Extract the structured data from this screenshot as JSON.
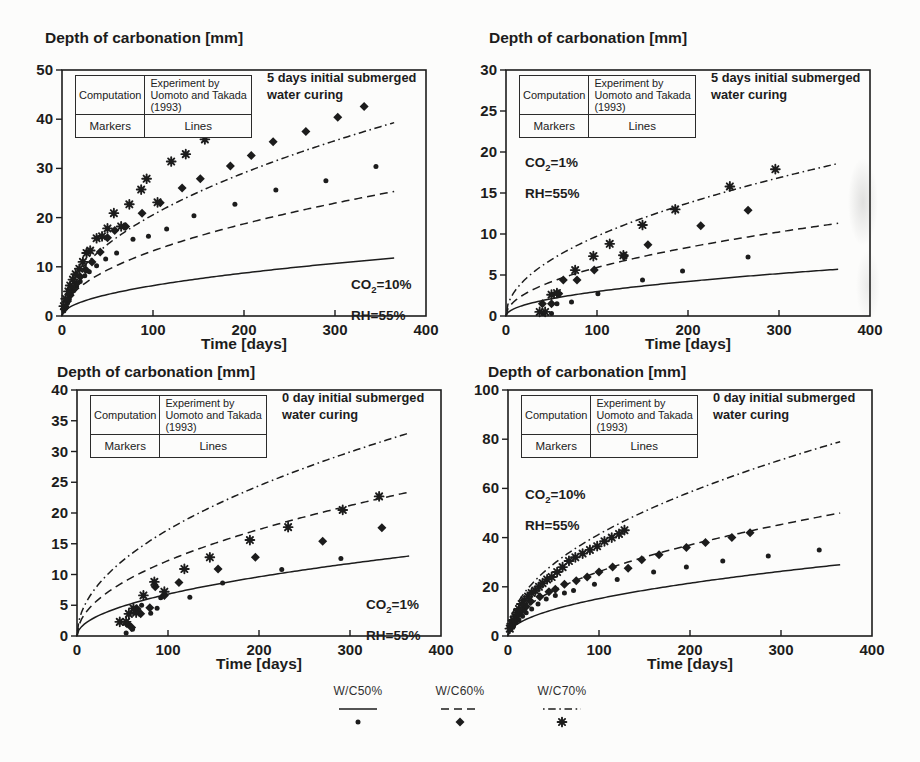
{
  "style": {
    "ink": "#1c1c1c",
    "paper": "#fcfcfb"
  },
  "inset_table": {
    "row1": [
      "Computation",
      "Experiment by Uomoto and Takada (1993)"
    ],
    "row2": [
      "Markers",
      "Lines"
    ]
  },
  "legend": {
    "items": [
      {
        "label": "W/C50%",
        "line_style": "solid",
        "marker": "dot"
      },
      {
        "label": "W/C60%",
        "line_style": "dashed",
        "marker": "diamond"
      },
      {
        "label": "W/C70%",
        "line_style": "dashdot",
        "marker": "star"
      }
    ]
  },
  "chart_data": [
    {
      "type": "line+scatter",
      "title": "Depth of carbonation [mm]",
      "xlabel": "Time [days]",
      "condition_note": "5 days initial submerged water curing",
      "co2": {
        "base": "CO",
        "sub": "2",
        "rest": "=10%"
      },
      "rh": "RH=55%",
      "xlim": [
        0,
        400
      ],
      "ylim": [
        0,
        50
      ],
      "xticks": [
        0,
        100,
        200,
        300,
        400
      ],
      "yticks": [
        0,
        10,
        20,
        30,
        40,
        50
      ],
      "series": [
        {
          "name": "W/C50% computation",
          "kind": "line",
          "style": "solid",
          "value_at_365": 11.8
        },
        {
          "name": "W/C60% computation",
          "kind": "line",
          "style": "dashed",
          "value_at_365": 25.3
        },
        {
          "name": "W/C70% computation",
          "kind": "line",
          "style": "dashdot",
          "value_at_365": 39.3
        },
        {
          "name": "W/C50% experiment",
          "kind": "scatter",
          "marker": "dot",
          "points": [
            [
              2,
              1
            ],
            [
              4,
              2
            ],
            [
              6,
              2.6
            ],
            [
              8,
              3.4
            ],
            [
              10,
              4.4
            ],
            [
              13,
              5.2
            ],
            [
              16,
              6
            ],
            [
              20,
              7
            ],
            [
              25,
              8.2
            ],
            [
              30,
              9
            ],
            [
              38,
              10.2
            ],
            [
              48,
              11.6
            ],
            [
              60,
              12.8
            ],
            [
              78,
              15.6
            ],
            [
              95,
              16.2
            ],
            [
              115,
              17.7
            ],
            [
              145,
              20.4
            ],
            [
              190,
              22.7
            ],
            [
              235,
              25.6
            ],
            [
              290,
              27.5
            ],
            [
              345,
              30.4
            ]
          ]
        },
        {
          "name": "W/C60% experiment",
          "kind": "scatter",
          "marker": "diamond",
          "points": [
            [
              3,
              1.6
            ],
            [
              6,
              3
            ],
            [
              9,
              4.2
            ],
            [
              12,
              5.4
            ],
            [
              16,
              6.6
            ],
            [
              20,
              8
            ],
            [
              26,
              9.4
            ],
            [
              33,
              11
            ],
            [
              42,
              13
            ],
            [
              50,
              15.9
            ],
            [
              58,
              17.4
            ],
            [
              70,
              18.2
            ],
            [
              88,
              20.9
            ],
            [
              108,
              23
            ],
            [
              132,
              26
            ],
            [
              152,
              27.9
            ],
            [
              185,
              30.5
            ],
            [
              208,
              32.6
            ],
            [
              232,
              35.4
            ],
            [
              268,
              37.5
            ],
            [
              303,
              40.4
            ],
            [
              332,
              42.6
            ]
          ]
        },
        {
          "name": "W/C70% experiment",
          "kind": "scatter",
          "marker": "star",
          "points": [
            [
              2,
              2
            ],
            [
              4,
              3.5
            ],
            [
              7,
              5
            ],
            [
              9,
              6.2
            ],
            [
              12,
              7.4
            ],
            [
              15,
              8.5
            ],
            [
              19,
              9.6
            ],
            [
              23,
              11
            ],
            [
              27,
              12.8
            ],
            [
              31,
              13.3
            ],
            [
              38,
              15.8
            ],
            [
              44,
              16.2
            ],
            [
              50,
              17.8
            ],
            [
              57,
              20.9
            ],
            [
              65,
              18.2
            ],
            [
              74,
              22.7
            ],
            [
              87,
              25.7
            ],
            [
              93,
              27.9
            ],
            [
              105,
              23.1
            ],
            [
              120,
              31.4
            ],
            [
              136,
              32.9
            ],
            [
              157,
              35.9
            ]
          ]
        }
      ]
    },
    {
      "type": "line+scatter",
      "title": "Depth of carbonation [mm]",
      "xlabel": "Time [days]",
      "condition_note": "5 days initial submerged water curing",
      "co2": {
        "base": "CO",
        "sub": "2",
        "rest": "=1%"
      },
      "rh": "RH=55%",
      "xlim": [
        0,
        400
      ],
      "ylim": [
        0,
        30
      ],
      "xticks": [
        0,
        100,
        200,
        300,
        400
      ],
      "yticks": [
        0,
        5,
        10,
        15,
        20,
        25,
        30
      ],
      "series": [
        {
          "name": "W/C50% computation",
          "kind": "line",
          "style": "solid",
          "value_at_365": 5.7
        },
        {
          "name": "W/C60% computation",
          "kind": "line",
          "style": "dashed",
          "value_at_365": 11.3
        },
        {
          "name": "W/C70% computation",
          "kind": "line",
          "style": "dashdot",
          "value_at_365": 18.6
        },
        {
          "name": "W/C50% experiment",
          "kind": "scatter",
          "marker": "dot",
          "points": [
            [
              41,
              0.3
            ],
            [
              50,
              0.3
            ],
            [
              56,
              1.5
            ],
            [
              72,
              1.7
            ],
            [
              101,
              2.7
            ],
            [
              150,
              4.4
            ],
            [
              194,
              5.5
            ],
            [
              266,
              7.2
            ]
          ]
        },
        {
          "name": "W/C60% experiment",
          "kind": "scatter",
          "marker": "diamond",
          "points": [
            [
              40,
              1.5
            ],
            [
              50,
              1.5
            ],
            [
              58,
              2.7
            ],
            [
              63,
              4.4
            ],
            [
              78,
              4.4
            ],
            [
              97,
              5.6
            ],
            [
              130,
              7.3
            ],
            [
              156,
              8.7
            ],
            [
              214,
              11
            ],
            [
              266,
              12.9
            ]
          ]
        },
        {
          "name": "W/C70% experiment",
          "kind": "scatter",
          "marker": "star",
          "points": [
            [
              37,
              0.5
            ],
            [
              43,
              0.5
            ],
            [
              50,
              2.6
            ],
            [
              56,
              2.8
            ],
            [
              76,
              5.6
            ],
            [
              96,
              7.3
            ],
            [
              114,
              8.8
            ],
            [
              129,
              7.4
            ],
            [
              150,
              11.1
            ],
            [
              186,
              13
            ],
            [
              246,
              15.8
            ],
            [
              296,
              17.9
            ]
          ]
        }
      ]
    },
    {
      "type": "line+scatter",
      "title": "Depth of carbonation [mm]",
      "xlabel": "Time [days]",
      "condition_note": "0 day initial submerged water curing",
      "co2": {
        "base": "CO",
        "sub": "2",
        "rest": "=1%"
      },
      "rh": "RH=55%",
      "xlim": [
        0,
        400
      ],
      "ylim": [
        0,
        40
      ],
      "xticks": [
        0,
        100,
        200,
        300,
        400
      ],
      "yticks": [
        0,
        5,
        10,
        15,
        20,
        25,
        30,
        35,
        40
      ],
      "series": [
        {
          "name": "W/C50% computation",
          "kind": "line",
          "style": "solid",
          "value_at_365": 13.0
        },
        {
          "name": "W/C60% computation",
          "kind": "line",
          "style": "dashed",
          "value_at_365": 23.4
        },
        {
          "name": "W/C70% computation",
          "kind": "line",
          "style": "dashdot",
          "value_at_365": 33.0
        },
        {
          "name": "W/C50% experiment",
          "kind": "scatter",
          "marker": "dot",
          "points": [
            [
              54,
              0.5
            ],
            [
              58,
              1.8
            ],
            [
              61,
              1.1
            ],
            [
              71,
              5
            ],
            [
              81,
              3.7
            ],
            [
              88,
              4.5
            ],
            [
              92,
              6.2
            ],
            [
              124,
              6.3
            ],
            [
              160,
              8.6
            ],
            [
              225,
              10.8
            ],
            [
              290,
              12.6
            ]
          ]
        },
        {
          "name": "W/C60% experiment",
          "kind": "scatter",
          "marker": "diamond",
          "points": [
            [
              55,
              2
            ],
            [
              60,
              1.4
            ],
            [
              66,
              4.4
            ],
            [
              70,
              3.6
            ],
            [
              80,
              4.6
            ],
            [
              86,
              8
            ],
            [
              96,
              6.6
            ],
            [
              112,
              8.7
            ],
            [
              155,
              10.9
            ],
            [
              196,
              12.8
            ],
            [
              270,
              15.4
            ],
            [
              335,
              17.6
            ]
          ]
        },
        {
          "name": "W/C70% experiment",
          "kind": "scatter",
          "marker": "star",
          "points": [
            [
              47,
              2.3
            ],
            [
              54,
              2.3
            ],
            [
              57,
              3.6
            ],
            [
              62,
              4.5
            ],
            [
              65,
              3.8
            ],
            [
              73,
              6.6
            ],
            [
              85,
              8.8
            ],
            [
              96,
              7.2
            ],
            [
              118,
              10.9
            ],
            [
              146,
              12.8
            ],
            [
              190,
              15.6
            ],
            [
              232,
              17.7
            ],
            [
              292,
              20.5
            ],
            [
              332,
              22.7
            ]
          ]
        }
      ]
    },
    {
      "type": "line+scatter",
      "title": "Depth of carbonation [mm]",
      "xlabel": "Time [days]",
      "condition_note": "0 day initial submerged water curing",
      "co2": {
        "base": "CO",
        "sub": "2",
        "rest": "=10%"
      },
      "rh": "RH=55%",
      "xlim": [
        0,
        400
      ],
      "ylim": [
        0,
        100
      ],
      "xticks": [
        0,
        100,
        200,
        300,
        400
      ],
      "yticks": [
        0,
        20,
        40,
        60,
        80,
        100
      ],
      "series": [
        {
          "name": "W/C50% computation",
          "kind": "line",
          "style": "solid",
          "value_at_365": 29
        },
        {
          "name": "W/C60% computation",
          "kind": "line",
          "style": "dashed",
          "value_at_365": 50
        },
        {
          "name": "W/C70% computation",
          "kind": "line",
          "style": "dashdot",
          "value_at_365": 79
        },
        {
          "name": "W/C50% experiment",
          "kind": "scatter",
          "marker": "dot",
          "points": [
            [
              3,
              2.5
            ],
            [
              6,
              4
            ],
            [
              9,
              5.5
            ],
            [
              12,
              6.5
            ],
            [
              16,
              8
            ],
            [
              20,
              9.5
            ],
            [
              26,
              11
            ],
            [
              33,
              13
            ],
            [
              42,
              15
            ],
            [
              52,
              16.5
            ],
            [
              62,
              17.5
            ],
            [
              72,
              18.5
            ],
            [
              95,
              21
            ],
            [
              120,
              23
            ],
            [
              160,
              26
            ],
            [
              196,
              28
            ],
            [
              236,
              30.5
            ],
            [
              286,
              32.5
            ],
            [
              342,
              35
            ]
          ]
        },
        {
          "name": "W/C60% experiment",
          "kind": "scatter",
          "marker": "diamond",
          "points": [
            [
              3,
              3.5
            ],
            [
              6,
              5.5
            ],
            [
              9,
              7
            ],
            [
              12,
              9
            ],
            [
              16,
              10.5
            ],
            [
              20,
              12
            ],
            [
              25,
              14
            ],
            [
              35,
              16
            ],
            [
              45,
              18
            ],
            [
              52,
              19
            ],
            [
              62,
              21
            ],
            [
              75,
              22.5
            ],
            [
              87,
              24
            ],
            [
              100,
              26
            ],
            [
              115,
              28
            ],
            [
              132,
              27.5
            ],
            [
              147,
              31
            ],
            [
              166,
              33
            ],
            [
              196,
              36
            ],
            [
              217,
              38
            ],
            [
              246,
              40
            ],
            [
              266,
              42
            ]
          ]
        },
        {
          "name": "W/C70% experiment",
          "kind": "scatter",
          "marker": "star",
          "points": [
            [
              2,
              3
            ],
            [
              4,
              5
            ],
            [
              6,
              6.5
            ],
            [
              8,
              8
            ],
            [
              10,
              9.5
            ],
            [
              12,
              11
            ],
            [
              15,
              13
            ],
            [
              18,
              14.5
            ],
            [
              22,
              16
            ],
            [
              26,
              17.5
            ],
            [
              30,
              18.5
            ],
            [
              34,
              20
            ],
            [
              38,
              21.5
            ],
            [
              43,
              23
            ],
            [
              48,
              24
            ],
            [
              54,
              26
            ],
            [
              60,
              28
            ],
            [
              67,
              30.5
            ],
            [
              74,
              32
            ],
            [
              82,
              33.5
            ],
            [
              90,
              35
            ],
            [
              98,
              36.5
            ],
            [
              106,
              38.5
            ],
            [
              114,
              40
            ],
            [
              122,
              41.5
            ],
            [
              128,
              43
            ]
          ]
        }
      ]
    }
  ]
}
